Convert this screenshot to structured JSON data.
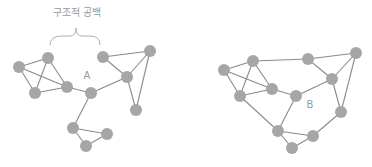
{
  "diagram": {
    "title_label": "구조적 공백",
    "left_network": {
      "node_label": "A",
      "nodes": [
        [
          19,
          67
        ],
        [
          48,
          58
        ],
        [
          35,
          93
        ],
        [
          67,
          87
        ],
        [
          91,
          93
        ],
        [
          103,
          57
        ],
        [
          150,
          51
        ],
        [
          127,
          77
        ],
        [
          136,
          110
        ],
        [
          73,
          128
        ],
        [
          107,
          134
        ],
        [
          86,
          146
        ]
      ],
      "edges": [
        [
          0,
          1
        ],
        [
          0,
          2
        ],
        [
          0,
          3
        ],
        [
          1,
          2
        ],
        [
          1,
          3
        ],
        [
          2,
          3
        ],
        [
          3,
          4
        ],
        [
          4,
          7
        ],
        [
          5,
          7
        ],
        [
          5,
          6
        ],
        [
          6,
          7
        ],
        [
          7,
          8
        ],
        [
          6,
          8
        ],
        [
          4,
          9
        ],
        [
          9,
          10
        ],
        [
          9,
          11
        ],
        [
          10,
          11
        ]
      ]
    },
    "right_network": {
      "node_label": "B",
      "nodes": [
        [
          224,
          70
        ],
        [
          253,
          61
        ],
        [
          240,
          96
        ],
        [
          272,
          89
        ],
        [
          296,
          96
        ],
        [
          308,
          59
        ],
        [
          356,
          53
        ],
        [
          332,
          79
        ],
        [
          341,
          112
        ],
        [
          278,
          131
        ],
        [
          313,
          136
        ],
        [
          292,
          148
        ]
      ],
      "edges": [
        [
          0,
          1
        ],
        [
          0,
          2
        ],
        [
          0,
          3
        ],
        [
          1,
          2
        ],
        [
          1,
          3
        ],
        [
          2,
          3
        ],
        [
          3,
          4
        ],
        [
          1,
          5
        ],
        [
          5,
          6
        ],
        [
          5,
          7
        ],
        [
          6,
          7
        ],
        [
          4,
          7
        ],
        [
          7,
          8
        ],
        [
          6,
          8
        ],
        [
          2,
          9
        ],
        [
          4,
          9
        ],
        [
          9,
          10
        ],
        [
          9,
          11
        ],
        [
          10,
          11
        ],
        [
          8,
          10
        ]
      ]
    },
    "colors": {
      "node": "#a6a6a6",
      "edge": "#8a8a8a",
      "label": "#9a9a9a"
    }
  }
}
